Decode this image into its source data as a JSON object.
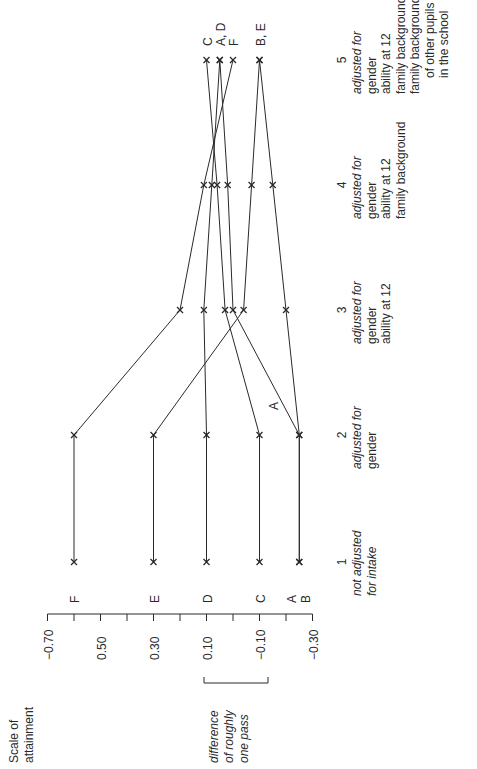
{
  "chart_data": {
    "type": "line",
    "orientation": "rotated-90-ccw",
    "title": "",
    "ylabel": "Scale of attainment",
    "xlabel": "",
    "ylim": [
      -0.3,
      0.7
    ],
    "yticks": [
      0.7,
      0.6,
      0.5,
      0.4,
      0.3,
      0.2,
      0.1,
      0.0,
      -0.1,
      -0.2,
      -0.3
    ],
    "ytick_labels": [
      "−0.70",
      "0.50",
      "0.30",
      "0.10",
      "−0.10",
      "−0.30"
    ],
    "categories": [
      {
        "number": "1",
        "lines": [
          "not adjusted",
          "for intake"
        ],
        "italic_lines": [
          0,
          1
        ]
      },
      {
        "number": "2",
        "lines": [
          "adjusted for",
          "gender"
        ],
        "italic_lines": [
          0
        ]
      },
      {
        "number": "3",
        "lines": [
          "adjusted for",
          "gender",
          "ability at 12"
        ],
        "italic_lines": [
          0
        ]
      },
      {
        "number": "4",
        "lines": [
          "adjusted for",
          "gender",
          "ability at 12",
          "family background"
        ],
        "italic_lines": [
          0
        ]
      },
      {
        "number": "5",
        "lines": [
          "adjusted for",
          "gender",
          "ability at 12",
          "family background",
          "family background",
          "of other pupils",
          "in the school"
        ],
        "italic_lines": [
          0
        ]
      }
    ],
    "series": [
      {
        "name": "A",
        "values": [
          -0.25,
          -0.25,
          0.0,
          0.02,
          0.05
        ]
      },
      {
        "name": "B",
        "values": [
          -0.25,
          -0.25,
          -0.2,
          -0.15,
          -0.1
        ]
      },
      {
        "name": "C",
        "values": [
          -0.1,
          -0.1,
          0.03,
          0.06,
          0.1
        ]
      },
      {
        "name": "D",
        "values": [
          0.1,
          0.1,
          0.11,
          0.08,
          0.05
        ]
      },
      {
        "name": "E",
        "values": [
          0.3,
          0.3,
          -0.04,
          -0.07,
          -0.1
        ]
      },
      {
        "name": "F",
        "values": [
          0.6,
          0.6,
          0.2,
          0.11,
          0.0
        ]
      }
    ],
    "start_labels": [
      {
        "text": "F",
        "value": 0.6
      },
      {
        "text": "E",
        "value": 0.3
      },
      {
        "text": "D",
        "value": 0.1
      },
      {
        "text": "C",
        "value": -0.1
      },
      {
        "text": "A",
        "value": -0.22
      },
      {
        "text": "B",
        "value": -0.27
      }
    ],
    "end_labels": [
      {
        "text": "C",
        "value": 0.1
      },
      {
        "text": "A, D",
        "value": 0.05
      },
      {
        "text": "F",
        "value": 0.0
      },
      {
        "text": "B, E",
        "value": -0.1
      }
    ],
    "annotations": [
      {
        "text": "A",
        "note": "inline label on line A between columns 2 and 3"
      },
      {
        "text": "difference of roughly one pass",
        "note": "bracket spanning approx 0.24 on scale"
      }
    ],
    "legend": "none",
    "grid": false
  },
  "text": {
    "axis_title_line1": "Scale of",
    "axis_title_line2": "attainment",
    "bracket_line1": "difference",
    "bracket_line2": "of roughly",
    "bracket_line3": "one pass",
    "inline_label_a": "A"
  }
}
